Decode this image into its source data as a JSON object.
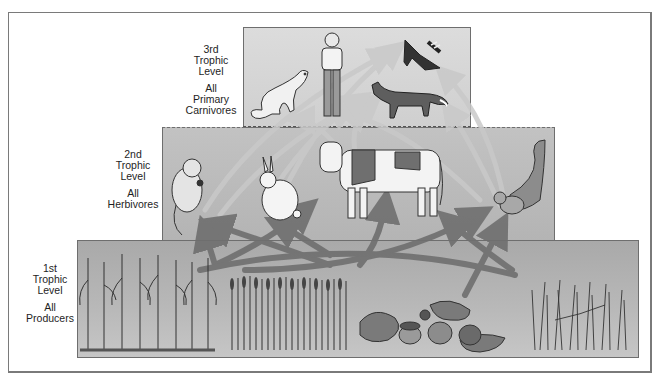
{
  "diagram": {
    "type": "trophic-pyramid",
    "levels": [
      {
        "id": "third",
        "label_line1": "3rd",
        "label_line2": "Trophic",
        "label_line3": "Level",
        "group_line1": "All",
        "group_line2": "Primary",
        "group_line3": "Carnivores",
        "organisms": [
          "weasel",
          "human",
          "raccoon",
          "fox"
        ]
      },
      {
        "id": "second",
        "label_line1": "2nd",
        "label_line2": "Trophic",
        "label_line3": "Level",
        "group_line1": "All",
        "group_line2": "Herbivores",
        "organisms": [
          "mouse",
          "rabbit",
          "cow",
          "squirrel"
        ]
      },
      {
        "id": "first",
        "label_line1": "1st",
        "label_line2": "Trophic",
        "label_line3": "Level",
        "group_line1": "All",
        "group_line2": "Producers",
        "organisms": [
          "corn",
          "wheat",
          "acorns-oak-leaves",
          "grasses"
        ]
      }
    ],
    "colors": {
      "frame": "#7a7a7a",
      "level3_fill": "#d6d6d6",
      "level2_fill": "#bcbcbc",
      "level1_fill": "#b2b2b2",
      "arrows_lower": "#6f6f6f",
      "arrows_upper": "#c8c8c8"
    }
  }
}
